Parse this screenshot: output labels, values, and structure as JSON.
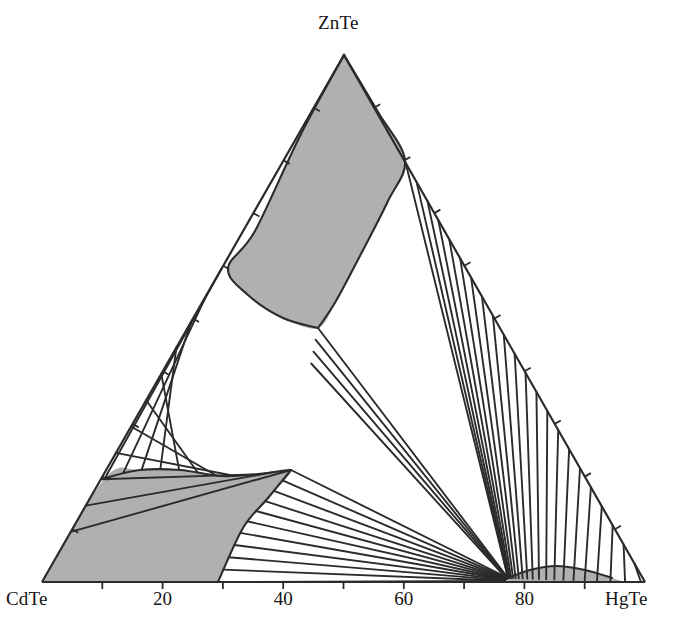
{
  "figure": {
    "type": "ternary-phase-diagram",
    "background_color": "#ffffff",
    "line_color": "#2b2b2b",
    "shade_color": "#b0b0b0"
  },
  "vertices": {
    "left": {
      "label": "CdTe",
      "x": 42,
      "y": 582
    },
    "right": {
      "label": "HgTe",
      "x": 645,
      "y": 582
    },
    "top": {
      "label": "ZnTe",
      "x": 344,
      "y": 55
    }
  },
  "bottom_axis": {
    "tick_labels": [
      "20",
      "40",
      "60",
      "80"
    ],
    "tick_values": [
      20,
      40,
      60,
      80
    ],
    "minor_tick_values": [
      10,
      30,
      50,
      70,
      90
    ]
  },
  "left_axis": {
    "tick_values": [
      10,
      20,
      30,
      40,
      50,
      60,
      70,
      80,
      90
    ]
  },
  "right_axis": {
    "tick_values": [
      10,
      20,
      30,
      40,
      50,
      60,
      70,
      80,
      90
    ]
  },
  "chart_data": {
    "type": "line",
    "title": "",
    "xlabel": "",
    "ylabel": "",
    "legend": [],
    "components": [
      "CdTe",
      "ZnTe",
      "HgTe"
    ],
    "axis_tick_labels": [
      "20",
      "40",
      "60",
      "80"
    ],
    "regions": [
      {
        "name": "znte-rich-two-phase-field",
        "shaded": true,
        "description": "Shaded two-phase lens extending from the ZnTe apex down to the interior triple point",
        "boundary_left": [
          [
            344,
            55
          ],
          [
            228,
            268
          ],
          [
            255,
            300
          ],
          [
            290,
            322
          ],
          [
            318,
            328
          ]
        ],
        "boundary_right": [
          [
            344,
            55
          ],
          [
            405,
            160
          ],
          [
            372,
            238
          ],
          [
            336,
            302
          ],
          [
            318,
            328
          ]
        ]
      },
      {
        "name": "cdte-rich-two-phase-field",
        "shaded": true,
        "description": "Shaded region in the CdTe corner bounded by the left edge, the bottom axis and the solidus curve",
        "boundary": [
          [
            42,
            582
          ],
          [
            105,
            478
          ],
          [
            160,
            472
          ],
          [
            220,
            478
          ],
          [
            262,
            474
          ],
          [
            291,
            470
          ],
          [
            247,
            520
          ],
          [
            218,
            582
          ]
        ]
      },
      {
        "name": "hgte-corner-sliver",
        "shaded": true,
        "description": "Narrow shaded sliver along the bottom axis near 78-90 percent HgTe",
        "boundary": [
          [
            508,
            578
          ],
          [
            548,
            566
          ],
          [
            610,
            578
          ]
        ]
      }
    ],
    "tie_line_fans": [
      {
        "name": "left-fan",
        "count": 11,
        "from_edge": "CdTe-ZnTe",
        "to_curve": "cdte-rich-solidus"
      },
      {
        "name": "upper-right-fan",
        "count": 22,
        "from_edge": "ZnTe-HgTe",
        "converges_near": [
          508,
          578
        ]
      },
      {
        "name": "lower-fan",
        "count": 11,
        "from_curve": "cdte-rich-solidus",
        "converges_near": [
          508,
          578
        ]
      }
    ]
  }
}
